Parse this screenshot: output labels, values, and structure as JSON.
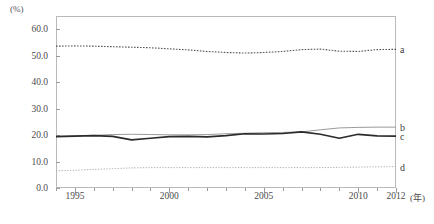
{
  "chart_data": {
    "type": "line",
    "title": "",
    "xlabel": "(年)",
    "ylabel": "(%)",
    "xlim": [
      1994,
      2012
    ],
    "ylim": [
      0,
      65
    ],
    "yticks": [
      "0.0",
      "10.0",
      "20.0",
      "30.0",
      "40.0",
      "50.0",
      "60.0"
    ],
    "ytick_values": [
      0,
      10,
      20,
      30,
      40,
      50,
      60
    ],
    "xticks": [
      "1995",
      "2000",
      "2005",
      "2010",
      "2012"
    ],
    "xtick_values": [
      1995,
      2000,
      2005,
      2010,
      2012
    ],
    "grid": false,
    "legend_position": "right-inline",
    "x": [
      1994,
      1995,
      1996,
      1997,
      1998,
      1999,
      2000,
      2001,
      2002,
      2003,
      2004,
      2005,
      2006,
      2007,
      2008,
      2009,
      2010,
      2011,
      2012
    ],
    "series": [
      {
        "name": "a",
        "label": "a",
        "style": "dotted",
        "color": "#555555",
        "values": [
          53.6,
          53.7,
          53.6,
          53.4,
          53.2,
          53.0,
          52.6,
          52.2,
          51.6,
          51.2,
          51.0,
          51.2,
          51.6,
          52.3,
          52.5,
          51.7,
          51.6,
          52.3,
          52.4
        ]
      },
      {
        "name": "b",
        "label": "b",
        "style": "solid-thin",
        "color": "#8e8e8e",
        "values": [
          19.5,
          19.7,
          19.9,
          20.2,
          20.3,
          20.2,
          20.1,
          20.1,
          20.2,
          20.5,
          20.7,
          20.9,
          21.0,
          21.2,
          22.0,
          22.7,
          22.9,
          23.0,
          23.0
        ]
      },
      {
        "name": "c",
        "label": "c",
        "style": "solid-bold",
        "color": "#2b2b2b",
        "values": [
          19.4,
          19.6,
          19.8,
          19.5,
          18.2,
          18.8,
          19.4,
          19.5,
          19.3,
          19.8,
          20.5,
          20.4,
          20.6,
          21.2,
          20.3,
          18.8,
          20.3,
          19.7,
          19.6
        ]
      },
      {
        "name": "d",
        "label": "d",
        "style": "dotted-light",
        "color": "#b0b0b0",
        "values": [
          6.5,
          6.7,
          7.0,
          7.3,
          7.6,
          7.7,
          7.7,
          7.7,
          7.7,
          7.7,
          7.7,
          7.7,
          7.7,
          7.7,
          7.7,
          7.8,
          7.9,
          8.0,
          8.1
        ]
      }
    ]
  }
}
